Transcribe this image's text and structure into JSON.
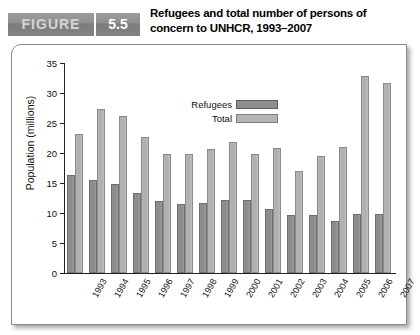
{
  "figure": {
    "word": "FIGURE",
    "number": "5.5",
    "title": "Refugees and total number of persons of concern to UNHCR, 1993–2007"
  },
  "legend": {
    "items": [
      {
        "label": "Refugees",
        "color": "#8d8d8d"
      },
      {
        "label": "Total",
        "color": "#b5b5b5"
      }
    ]
  },
  "chart_data": {
    "type": "bar",
    "title": "Refugees and total number of persons of concern to UNHCR, 1993–2007",
    "xlabel": "",
    "ylabel": "Population (millions)",
    "ylim": [
      0,
      35
    ],
    "yticks": [
      0,
      5,
      10,
      15,
      20,
      25,
      30,
      35
    ],
    "grid": false,
    "legend_position": "inside-top-center",
    "categories": [
      "1993",
      "1994",
      "1995",
      "1996",
      "1997",
      "1998",
      "1999",
      "2000",
      "2001",
      "2002",
      "2003",
      "2004",
      "2005",
      "2006",
      "2007"
    ],
    "series": [
      {
        "name": "Refugees",
        "color": "#8d8d8d",
        "values": [
          16.3,
          15.5,
          14.9,
          13.4,
          12.0,
          11.5,
          11.7,
          12.1,
          12.1,
          10.6,
          9.6,
          9.6,
          8.7,
          9.9,
          9.9
        ]
      },
      {
        "name": "Total",
        "color": "#b5b5b5",
        "values": [
          23.2,
          27.4,
          26.1,
          22.7,
          19.8,
          19.9,
          20.6,
          21.9,
          19.9,
          20.8,
          17.0,
          19.5,
          21.0,
          32.9,
          31.7
        ]
      }
    ]
  }
}
